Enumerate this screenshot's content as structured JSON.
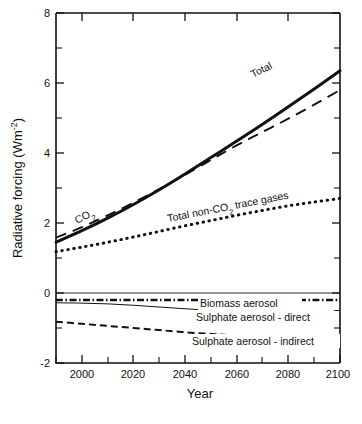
{
  "figure": {
    "title": "",
    "caption": ""
  },
  "axes": {
    "xlabel": "Year",
    "ylabel_main": "Radiative forcing (Wm",
    "ylabel_sup": "-2",
    "ylabel_close": ")",
    "ylabel_full": "Radiative forcing (Wm-2)",
    "xticklabels": [
      "2000",
      "2020",
      "2040",
      "2060",
      "2080",
      "2100"
    ],
    "yticklabels": [
      "8",
      "6",
      "4",
      "2",
      "0",
      "-2"
    ]
  },
  "chart_data": {
    "type": "line",
    "title": "",
    "xlabel": "Year",
    "ylabel": "Radiative forcing (Wm-2)",
    "xlim": [
      1990,
      2100
    ],
    "ylim": [
      -2,
      8
    ],
    "xticks": [
      2000,
      2020,
      2040,
      2060,
      2080,
      2100
    ],
    "xticks_minor": [
      1990,
      2010,
      2030,
      2050,
      2070,
      2090
    ],
    "yticks": [
      -2,
      0,
      2,
      4,
      6,
      8
    ],
    "yticks_minor": [
      -1,
      1,
      3,
      5,
      7
    ],
    "grid": false,
    "legend": "inline-annotations",
    "x": [
      1990,
      2000,
      2010,
      2020,
      2030,
      2040,
      2050,
      2060,
      2070,
      2080,
      2090,
      2100
    ],
    "series": [
      {
        "name": "Total",
        "label": "Total",
        "style": "solid-thick",
        "values": [
          1.45,
          1.78,
          2.14,
          2.53,
          2.95,
          3.4,
          3.87,
          4.34,
          4.82,
          5.32,
          5.83,
          6.35
        ]
      },
      {
        "name": "CO2",
        "label": "CO2",
        "style": "dashed",
        "values": [
          1.58,
          1.88,
          2.22,
          2.58,
          2.97,
          3.38,
          3.8,
          4.22,
          4.6,
          4.98,
          5.38,
          5.8
        ]
      },
      {
        "name": "Total non-CO2 trace gases",
        "label": "Total non-CO2 trace gases",
        "style": "dotted",
        "values": [
          1.18,
          1.31,
          1.45,
          1.6,
          1.76,
          1.92,
          2.07,
          2.22,
          2.36,
          2.49,
          2.6,
          2.7
        ]
      },
      {
        "name": "Biomass aerosol",
        "label": "Biomass aerosol",
        "style": "dash-dot",
        "values": [
          -0.2,
          -0.2,
          -0.2,
          -0.2,
          -0.2,
          -0.2,
          -0.2,
          -0.2,
          -0.2,
          -0.2,
          -0.2,
          -0.2
        ]
      },
      {
        "name": "Sulphate aerosol - direct",
        "label": "Sulphate aerosol - direct",
        "style": "solid-thin",
        "values": [
          -0.28,
          -0.29,
          -0.31,
          -0.35,
          -0.4,
          -0.45,
          -0.49,
          -0.5,
          -0.5,
          -0.5,
          -0.5,
          -0.5
        ]
      },
      {
        "name": "Sulphate aerosol - indirect",
        "label": "Sulphate aerosol - indirect",
        "style": "dashed-thick",
        "values": [
          -0.82,
          -0.88,
          -0.94,
          -1.0,
          -1.06,
          -1.12,
          -1.17,
          -1.21,
          -1.23,
          -1.24,
          -1.25,
          -1.25
        ]
      }
    ],
    "annotations": [
      {
        "text": "Total",
        "x": 2072,
        "y": 5.45,
        "rotation": -27
      },
      {
        "text": "CO2",
        "x": 2009,
        "y": 2.45,
        "rotation": -27
      },
      {
        "text": "Total non-CO2 trace gases",
        "x": 2046,
        "y": 2.55,
        "rotation": -11
      },
      {
        "text": "Biomass aerosol",
        "x": 2060,
        "y": -0.4,
        "rotation": 0
      },
      {
        "text": "Sulphate aerosol - direct",
        "x": 2062,
        "y": -0.72,
        "rotation": 0
      },
      {
        "text": "Sulphate aerosol - indirect",
        "x": 2063,
        "y": -1.45,
        "rotation": 0
      }
    ]
  }
}
